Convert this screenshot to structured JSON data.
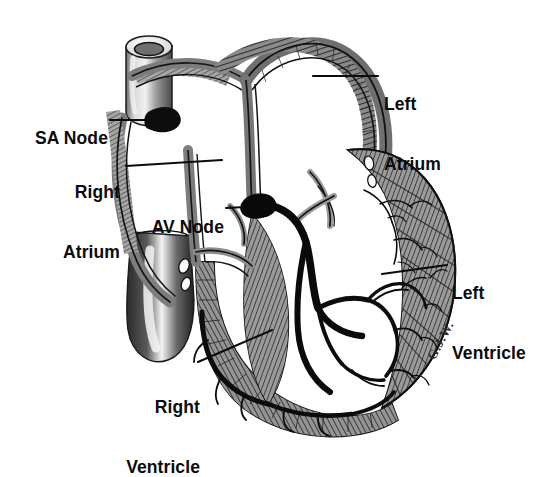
{
  "figure": {
    "background_color": "#ffffff",
    "ink_color": "#0b0b0b",
    "artist_signature": "G.J.W."
  },
  "labels": [
    {
      "id": "sa-node",
      "text": "SA Node",
      "lines": [
        "SA Node"
      ],
      "align": "right",
      "x": 34,
      "y": 108,
      "leader": {
        "from": [
          110,
          120
        ],
        "to": [
          150,
          120
        ]
      }
    },
    {
      "id": "right-atrium",
      "text": "Right Atrium",
      "lines": [
        "Right",
        "Atrium"
      ],
      "align": "right",
      "x": 56,
      "y": 142,
      "leader": {
        "from": [
          126,
          166
        ],
        "to": [
          222,
          160
        ]
      }
    },
    {
      "id": "av-node",
      "text": "AV Node",
      "lines": [
        "AV Node"
      ],
      "align": "right",
      "x": 152,
      "y": 197,
      "leader": {
        "from": [
          226,
          208
        ],
        "to": [
          246,
          207
        ]
      }
    },
    {
      "id": "left-atrium",
      "text": "Left Atrium",
      "lines": [
        "Left",
        "Atrium"
      ],
      "align": "left",
      "x": 384,
      "y": 54,
      "leader": {
        "from": [
          378,
          76
        ],
        "to": [
          313,
          76
        ]
      }
    },
    {
      "id": "left-ventricle",
      "text": "Left Ventricle",
      "lines": [
        "Left",
        "Ventricle"
      ],
      "align": "left",
      "x": 450,
      "y": 243,
      "leader": {
        "from": [
          447,
          265
        ],
        "to": [
          382,
          274
        ]
      }
    },
    {
      "id": "right-ventricle",
      "text": "Right Ventricle",
      "lines": [
        "Right",
        "Ventricle"
      ],
      "align": "right",
      "x": 106,
      "y": 357,
      "leader": {
        "from": [
          198,
          362
        ],
        "to": [
          272,
          330
        ]
      }
    }
  ],
  "structures": [
    {
      "id": "superior-vena-cava",
      "name": "Superior vena cava"
    },
    {
      "id": "inferior-vena-cava",
      "name": "Inferior vena cava"
    },
    {
      "id": "right-atrium-chamber",
      "name": "Right atrium chamber"
    },
    {
      "id": "left-atrium-chamber",
      "name": "Left atrium chamber"
    },
    {
      "id": "right-ventricle-chamber",
      "name": "Right ventricle chamber"
    },
    {
      "id": "left-ventricle-chamber",
      "name": "Left ventricle chamber"
    },
    {
      "id": "interatrial-septum",
      "name": "Interatrial septum"
    },
    {
      "id": "interventricular-septum",
      "name": "Interventricular septum"
    },
    {
      "id": "sa-node-body",
      "name": "Sinoatrial node"
    },
    {
      "id": "av-node-body",
      "name": "Atrioventricular node"
    },
    {
      "id": "bundle-of-his",
      "name": "Bundle of His"
    },
    {
      "id": "purkinje-fibers-left",
      "name": "Left bundle branch / Purkinje fibers"
    },
    {
      "id": "purkinje-fibers-right",
      "name": "Right bundle branch / Purkinje fibers"
    },
    {
      "id": "tricuspid-valve",
      "name": "Tricuspid valve leaflets"
    },
    {
      "id": "mitral-valve",
      "name": "Mitral valve leaflets"
    },
    {
      "id": "myocardium-left",
      "name": "Left ventricular myocardium"
    },
    {
      "id": "myocardium-right",
      "name": "Right ventricular myocardium"
    }
  ]
}
